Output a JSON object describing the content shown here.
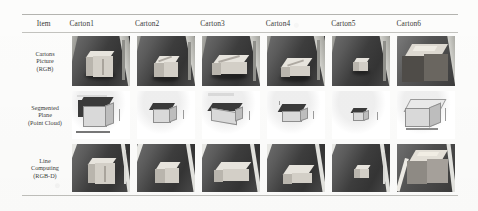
{
  "figure": {
    "type": "results-table",
    "background_color": "#fcfcfb",
    "rule_color": "#b9b9b6",
    "text_color": "#3a3a38"
  },
  "table": {
    "header": {
      "item_label": "Item",
      "columns": [
        {
          "label": "Carton1"
        },
        {
          "label": "Carton2"
        },
        {
          "label": "Carton3"
        },
        {
          "label": "Carton4"
        },
        {
          "label": "Carton5"
        },
        {
          "label": "Carton6"
        }
      ]
    },
    "rows": [
      {
        "id": "cartons-picture-rgb",
        "label_lines": [
          "Cartons",
          "Picture",
          "(RGB)"
        ],
        "modality": "RGB",
        "cells": [
          {
            "caption": "Carton1 RGB photo",
            "kind": "photo",
            "box": "tall-upright"
          },
          {
            "caption": "Carton2 RGB photo",
            "kind": "photo",
            "box": "cube"
          },
          {
            "caption": "Carton3 RGB photo",
            "kind": "photo",
            "box": "long-flat"
          },
          {
            "caption": "Carton4 RGB photo",
            "kind": "photo",
            "box": "wide-flat"
          },
          {
            "caption": "Carton5 RGB photo",
            "kind": "photo",
            "box": "small-cube"
          },
          {
            "caption": "Carton6 RGB photo",
            "kind": "photo",
            "box": "large-open"
          }
        ]
      },
      {
        "id": "segmented-plane-point-cloud",
        "label_lines": [
          "Segmented",
          "Plane",
          "(Point Cloud)"
        ],
        "modality": "Point Cloud",
        "cells": [
          {
            "caption": "Carton1 segmented plane",
            "kind": "pointcloud",
            "box": "tall-upright"
          },
          {
            "caption": "Carton2 segmented plane",
            "kind": "pointcloud",
            "box": "cube"
          },
          {
            "caption": "Carton3 segmented plane",
            "kind": "pointcloud",
            "box": "long-flat"
          },
          {
            "caption": "Carton4 segmented plane",
            "kind": "pointcloud",
            "box": "wide-flat"
          },
          {
            "caption": "Carton5 segmented plane",
            "kind": "pointcloud",
            "box": "small-cube"
          },
          {
            "caption": "Carton6 segmented plane",
            "kind": "pointcloud",
            "box": "large-open"
          }
        ]
      },
      {
        "id": "line-computing-rgbd",
        "label_lines": [
          "Line",
          "Computing",
          "(RGB-D)"
        ],
        "modality": "RGB-D",
        "cells": [
          {
            "caption": "Carton1 line computing",
            "kind": "photo",
            "box": "tall-upright"
          },
          {
            "caption": "Carton2 line computing",
            "kind": "photo",
            "box": "cube"
          },
          {
            "caption": "Carton3 line computing",
            "kind": "photo",
            "box": "long-flat"
          },
          {
            "caption": "Carton4 line computing",
            "kind": "photo",
            "box": "wide-flat"
          },
          {
            "caption": "Carton5 line computing",
            "kind": "photo",
            "box": "small-cube"
          },
          {
            "caption": "Carton6 line computing",
            "kind": "photo",
            "box": "large-open"
          }
        ]
      }
    ]
  }
}
